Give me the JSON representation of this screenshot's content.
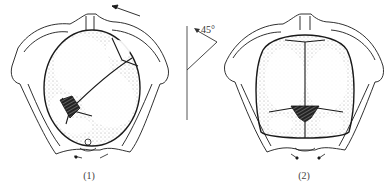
{
  "figure": {
    "panels": [
      {
        "id": 1,
        "caption": "(1)",
        "description": "fetal head in pelvis, sagittal suture oblique, posterior fontanelle at lower left"
      },
      {
        "id": 2,
        "caption": "(2)",
        "description": "fetal head in pelvis after rotation, sagittal suture vertical"
      }
    ],
    "rotation_indicator": {
      "angle_label": "45°"
    },
    "colors": {
      "line": "#1a1a1a",
      "stipple": "#555555",
      "background": "#ffffff"
    }
  }
}
